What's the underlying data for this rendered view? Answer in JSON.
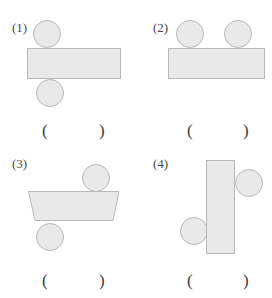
{
  "page": {
    "width": 272,
    "height": 298,
    "background": "#ffffff",
    "cropped_top_text": "",
    "shape_fill": "#e9e9e9",
    "shape_stroke": "#b9b9b9",
    "text_color": "#3d3d3d"
  },
  "panels": [
    {
      "label": "(1)",
      "answer_open": "(",
      "answer_close": ")",
      "description": "horizontal-bar-with-circle-above-left-and-circle-below-left"
    },
    {
      "label": "(2)",
      "answer_open": "(",
      "answer_close": ")",
      "description": "horizontal-bar-with-two-circles-on-top"
    },
    {
      "label": "(3)",
      "answer_open": "(",
      "answer_close": ")",
      "description": "trapezoid-with-circle-above-right-and-circle-below-left"
    },
    {
      "label": "(4)",
      "answer_open": "(",
      "answer_close": ")",
      "description": "vertical-bar-with-circle-upper-right-and-circle-lower-left"
    }
  ]
}
